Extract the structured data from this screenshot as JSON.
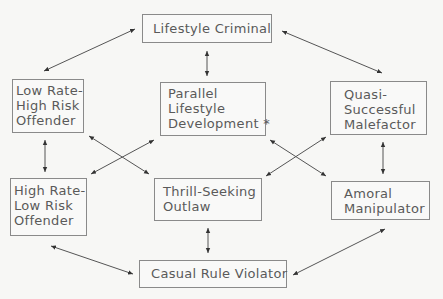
{
  "diagram": {
    "nodes": {
      "lifestyle_criminal": {
        "lines": [
          "Lifestyle Criminal"
        ]
      },
      "low_rate": {
        "lines": [
          "Low Rate-",
          "High Risk",
          "Offender"
        ]
      },
      "parallel": {
        "lines": [
          "Parallel",
          "Lifestyle",
          "Development  *"
        ]
      },
      "quasi": {
        "lines": [
          "Quasi-",
          "Successful",
          "Malefactor"
        ]
      },
      "high_rate": {
        "lines": [
          "High Rate-",
          "Low Risk",
          "Offender"
        ]
      },
      "thrill": {
        "lines": [
          "Thrill-Seeking",
          "Outlaw"
        ]
      },
      "amoral": {
        "lines": [
          "Amoral",
          "Manipulator"
        ]
      },
      "casual": {
        "lines": [
          "Casual Rule Violator"
        ]
      }
    },
    "edges": [
      {
        "from": "lifestyle_criminal",
        "to": "low_rate",
        "bidirectional": true
      },
      {
        "from": "lifestyle_criminal",
        "to": "parallel",
        "bidirectional": true
      },
      {
        "from": "lifestyle_criminal",
        "to": "quasi",
        "bidirectional": true
      },
      {
        "from": "low_rate",
        "to": "high_rate",
        "bidirectional": true
      },
      {
        "from": "low_rate",
        "to": "thrill",
        "bidirectional": true
      },
      {
        "from": "parallel",
        "to": "high_rate",
        "bidirectional": true
      },
      {
        "from": "parallel",
        "to": "amoral",
        "bidirectional": true
      },
      {
        "from": "quasi",
        "to": "thrill",
        "bidirectional": true
      },
      {
        "from": "quasi",
        "to": "amoral",
        "bidirectional": true
      },
      {
        "from": "thrill",
        "to": "casual",
        "bidirectional": true
      },
      {
        "from": "high_rate",
        "to": "casual",
        "bidirectional": true
      },
      {
        "from": "amoral",
        "to": "casual",
        "bidirectional": true
      }
    ]
  }
}
